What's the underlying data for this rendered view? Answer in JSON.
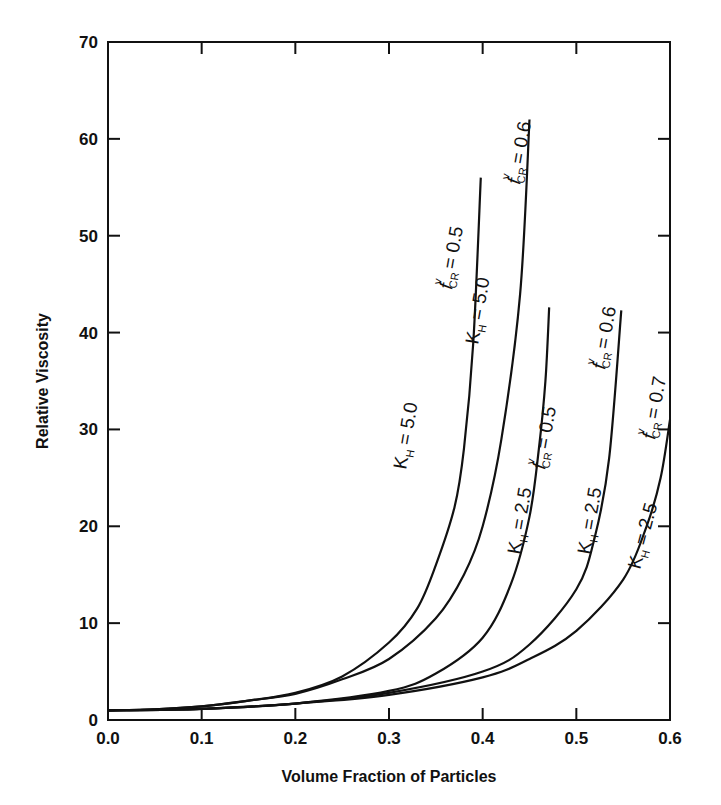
{
  "chart_data": {
    "type": "line",
    "title": "",
    "xlabel": "Volume Fraction of Particles",
    "ylabel": "Relative Viscosity",
    "xlim": [
      0.0,
      0.6
    ],
    "ylim": [
      0,
      70
    ],
    "x_ticks": [
      "0.0",
      "0.1",
      "0.2",
      "0.3",
      "0.4",
      "0.5",
      "0.6"
    ],
    "y_ticks": [
      "0",
      "10",
      "20",
      "30",
      "40",
      "50",
      "60",
      "70"
    ],
    "grid": false,
    "legend": "none (inline curve labels)",
    "series": [
      {
        "name": "K_H = 5.0, f^v_CR = 0.5",
        "label_kh": "K",
        "label_kh_sub": "H",
        "label_kh_val": "= 5.0",
        "label_f": "f",
        "label_f_sup": "v",
        "label_f_sub": "CR",
        "label_f_val": "= 0.5",
        "points": [
          [
            0,
            1
          ],
          [
            0.05,
            1.1
          ],
          [
            0.1,
            1.4
          ],
          [
            0.15,
            2.0
          ],
          [
            0.2,
            2.8
          ],
          [
            0.25,
            4.5
          ],
          [
            0.3,
            8
          ],
          [
            0.33,
            11.5
          ],
          [
            0.35,
            16
          ],
          [
            0.37,
            22
          ],
          [
            0.38,
            28
          ],
          [
            0.39,
            39
          ],
          [
            0.398,
            56
          ]
        ]
      },
      {
        "name": "K_H = 5.0, f^v_CR = 0.6",
        "label_kh": "K",
        "label_kh_sub": "H",
        "label_kh_val": "= 5.0",
        "label_f": "f",
        "label_f_sup": "v",
        "label_f_sub": "CR",
        "label_f_val": "= 0.6",
        "points": [
          [
            0,
            1
          ],
          [
            0.05,
            1.1
          ],
          [
            0.1,
            1.4
          ],
          [
            0.15,
            2.0
          ],
          [
            0.2,
            2.7
          ],
          [
            0.25,
            4.2
          ],
          [
            0.3,
            6.3
          ],
          [
            0.35,
            10.5
          ],
          [
            0.38,
            15
          ],
          [
            0.4,
            20
          ],
          [
            0.42,
            29
          ],
          [
            0.44,
            44
          ],
          [
            0.45,
            62
          ]
        ]
      },
      {
        "name": "K_H = 2.5, f^v_CR = 0.5",
        "label_kh": "K",
        "label_kh_sub": "H",
        "label_kh_val": "= 2.5",
        "label_f": "f",
        "label_f_sup": "v",
        "label_f_sub": "CR",
        "label_f_val": "= 0.5",
        "points": [
          [
            0,
            1
          ],
          [
            0.1,
            1.15
          ],
          [
            0.2,
            1.7
          ],
          [
            0.3,
            3.0
          ],
          [
            0.35,
            4.8
          ],
          [
            0.4,
            8.5
          ],
          [
            0.43,
            14
          ],
          [
            0.45,
            21
          ],
          [
            0.46,
            28
          ],
          [
            0.467,
            35
          ],
          [
            0.471,
            42.6
          ]
        ]
      },
      {
        "name": "K_H = 2.5, f^v_CR = 0.6",
        "label_kh": "K",
        "label_kh_sub": "H",
        "label_kh_val": "= 2.5",
        "label_f": "f",
        "label_f_sup": "v",
        "label_f_sub": "CR",
        "label_f_val": "= 0.6",
        "points": [
          [
            0,
            1
          ],
          [
            0.1,
            1.15
          ],
          [
            0.2,
            1.7
          ],
          [
            0.3,
            2.8
          ],
          [
            0.4,
            5.0
          ],
          [
            0.45,
            7.8
          ],
          [
            0.5,
            13.5
          ],
          [
            0.52,
            19
          ],
          [
            0.535,
            27
          ],
          [
            0.548,
            42.3
          ]
        ]
      },
      {
        "name": "K_H = 2.5, f^v_CR = 0.7",
        "label_kh": "K",
        "label_kh_sub": "H",
        "label_kh_val": "= 2.5",
        "label_f": "f",
        "label_f_sup": "v",
        "label_f_sub": "CR",
        "label_f_val": "= 0.7",
        "points": [
          [
            0,
            1
          ],
          [
            0.1,
            1.15
          ],
          [
            0.2,
            1.7
          ],
          [
            0.3,
            2.6
          ],
          [
            0.4,
            4.4
          ],
          [
            0.45,
            6.3
          ],
          [
            0.5,
            9.2
          ],
          [
            0.55,
            14.5
          ],
          [
            0.575,
            20
          ],
          [
            0.59,
            25
          ],
          [
            0.6,
            31
          ]
        ]
      }
    ],
    "annotations": [
      {
        "text": "K_H = 5.0",
        "series": 0
      },
      {
        "text": "f^v_CR = 0.5",
        "series": 0
      },
      {
        "text": "K_H = 5.0",
        "series": 1
      },
      {
        "text": "f^v_CR = 0.6",
        "series": 1
      },
      {
        "text": "K_H = 2.5",
        "series": 2
      },
      {
        "text": "f^v_CR = 0.5",
        "series": 2
      },
      {
        "text": "K_H = 2.5",
        "series": 3
      },
      {
        "text": "f^v_CR = 0.6",
        "series": 3
      },
      {
        "text": "K_H = 2.5",
        "series": 4
      },
      {
        "text": "f^v_CR = 0.7",
        "series": 4
      }
    ],
    "line_color": "#111111"
  },
  "layout": {
    "plot": {
      "left": 108,
      "top": 42,
      "right": 670,
      "bottom": 720
    },
    "label_positions": [
      {
        "kh": [
          406,
          470,
          -80
        ],
        "f": [
          452,
          290,
          -80
        ]
      },
      {
        "kh": [
          478,
          345,
          -80
        ],
        "f": [
          520,
          185,
          -80
        ]
      },
      {
        "kh": [
          520,
          555,
          -80
        ],
        "f": [
          545,
          470,
          -80
        ]
      },
      {
        "kh": [
          590,
          555,
          -80
        ],
        "f": [
          605,
          370,
          -80
        ]
      },
      {
        "kh": [
          640,
          570,
          -75
        ],
        "f": [
          655,
          440,
          -80
        ]
      }
    ]
  },
  "caption_partial": ""
}
